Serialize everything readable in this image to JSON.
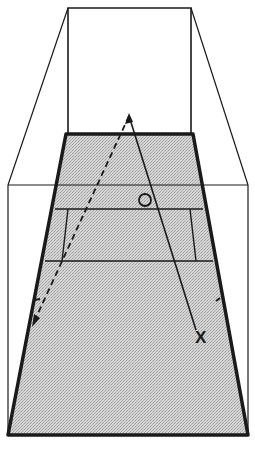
{
  "diagram": {
    "colors": {
      "background": "#ffffff",
      "floor": "#cfcfcf",
      "line": "#1a1a1a"
    },
    "walls": {
      "front_wall": {
        "x1": 68,
        "y1": 8,
        "x2": 191,
        "y2": 134
      },
      "side_left_top": {
        "from": [
          68,
          8
        ],
        "to": [
          8,
          185
        ]
      },
      "side_right_top": {
        "from": [
          191,
          8
        ],
        "to": [
          248,
          185
        ]
      },
      "outer_box": {
        "left": 8,
        "right": 248,
        "top": 185,
        "bottom": 435
      }
    },
    "floor": {
      "points": [
        [
          66,
          134
        ],
        [
          193,
          134
        ],
        [
          248,
          435
        ],
        [
          8,
          435
        ]
      ]
    },
    "court_lines": {
      "short_line_upper_y": 185,
      "short_line_y": 209,
      "service_line_y": 261
    },
    "ball": {
      "cx": 145,
      "cy": 200,
      "r": 6,
      "label": "O"
    },
    "player_marker": {
      "label": "X",
      "x": 201,
      "y": 338
    },
    "paths": {
      "solid": {
        "from": [
          129,
          116
        ],
        "to": [
          196,
          330
        ]
      },
      "dashed": {
        "from": [
          129,
          116
        ],
        "to": [
          32,
          326
        ]
      }
    }
  }
}
